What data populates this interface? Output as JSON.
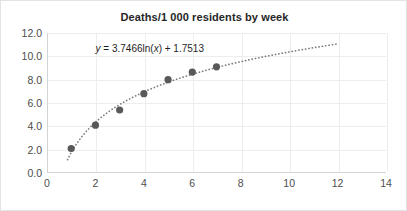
{
  "chart_data": {
    "type": "scatter",
    "title": "Deaths/1 000 residents by week",
    "xlabel": "",
    "ylabel": "",
    "xlim": [
      0,
      14
    ],
    "ylim": [
      0,
      12
    ],
    "xticks": [
      "0",
      "2",
      "4",
      "6",
      "8",
      "10",
      "12",
      "14"
    ],
    "xtick_values": [
      0,
      2,
      4,
      6,
      8,
      10,
      12,
      14
    ],
    "yticks": [
      "0.0",
      "2.0",
      "4.0",
      "6.0",
      "8.0",
      "10.0",
      "12.0"
    ],
    "ytick_values": [
      0,
      2,
      4,
      6,
      8,
      10,
      12
    ],
    "grid": true,
    "legend": "none",
    "series": [
      {
        "name": "Deaths per 1 000 residents",
        "marker": "circle",
        "color": "#595959",
        "x": [
          1,
          2,
          3,
          4,
          5,
          6,
          7
        ],
        "values": [
          2.1,
          4.1,
          5.4,
          6.8,
          8.0,
          8.65,
          9.1
        ]
      }
    ],
    "trendline": {
      "type": "logarithmic",
      "equation": "y = 3.7466ln(x) + 1.7513",
      "equation_prefix": "y",
      "equation_body": " = 3.7466ln(",
      "equation_var": "x",
      "equation_suffix": ") + 1.7513",
      "slope": 3.7466,
      "intercept": 1.7513,
      "style": "dotted",
      "color": "#7f7f7f",
      "x_start": 0.85,
      "x_end": 12.0
    },
    "annotations": [
      {
        "text": "y = 3.7466ln(x) + 1.7513",
        "x": 4.4,
        "y": 10.6
      }
    ]
  },
  "colors": {
    "marker": "#595959",
    "trendline": "#7f7f7f",
    "grid": "#ededed",
    "axis": "#d4d4d4",
    "text": "#4d4d4d",
    "title": "#262626",
    "background": "#ffffff",
    "border": "#e3e3e3"
  }
}
